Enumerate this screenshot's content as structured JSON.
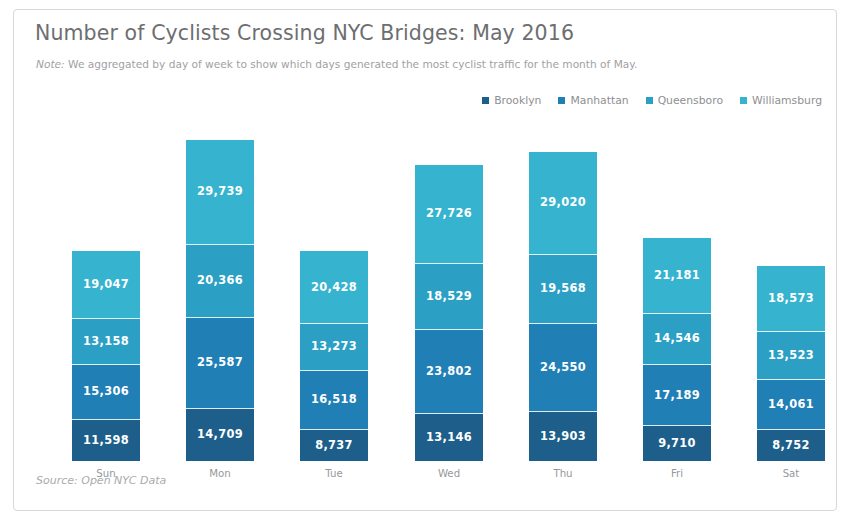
{
  "card": {
    "title": "Number of Cyclists Crossing NYC Bridges: May 2016",
    "note_prefix": "Note:",
    "note_text": " We aggregated by day of week to show which days generated the most cyclist traffic for the month of May.",
    "source": "Source: Open NYC Data"
  },
  "legend": {
    "items": [
      {
        "label": "Brooklyn",
        "color": "#1d5f8a"
      },
      {
        "label": "Manhattan",
        "color": "#2080b6"
      },
      {
        "label": "Queensboro",
        "color": "#2ba0c4"
      },
      {
        "label": "Williamsburg",
        "color": "#35b3cf"
      }
    ]
  },
  "chart_data": {
    "type": "bar",
    "stacked": true,
    "title": "Number of Cyclists Crossing NYC Bridges: May 2016",
    "subtitle": "Note: We aggregated by day of week to show which days generated the most cyclist traffic for the month of May.",
    "xlabel": "",
    "ylabel": "",
    "grid": false,
    "legend_position": "top-right",
    "axis_visible": false,
    "ylim": [
      0,
      90401
    ],
    "categories": [
      "Sun",
      "Mon",
      "Tue",
      "Wed",
      "Thu",
      "Fri",
      "Sat"
    ],
    "series": [
      {
        "name": "Brooklyn",
        "color": "#1d5f8a",
        "values": [
          11598,
          14709,
          8737,
          13146,
          13903,
          9710,
          8752
        ],
        "labels": [
          "11,598",
          "14,709",
          "8,737",
          "13,146",
          "13,903",
          "9,710",
          "8,752"
        ]
      },
      {
        "name": "Manhattan",
        "color": "#2080b6",
        "values": [
          15306,
          25587,
          16518,
          23802,
          24550,
          17189,
          14061
        ],
        "labels": [
          "15,306",
          "25,587",
          "16,518",
          "23,802",
          "24,550",
          "17,189",
          "14,061"
        ]
      },
      {
        "name": "Queensboro",
        "color": "#2ba0c4",
        "values": [
          13158,
          20366,
          13273,
          18529,
          19568,
          14546,
          13523
        ],
        "labels": [
          "13,158",
          "20,366",
          "13,273",
          "18,529",
          "19,568",
          "14,546",
          "13,523"
        ]
      },
      {
        "name": "Williamsburg",
        "color": "#35b3cf",
        "values": [
          19047,
          29739,
          20428,
          27726,
          29020,
          21181,
          18573
        ],
        "labels": [
          "19,047",
          "29,739",
          "20,428",
          "27,726",
          "29,020",
          "21,181",
          "18,573"
        ]
      }
    ],
    "totals": [
      59109,
      90401,
      58956,
      83203,
      87041,
      62626,
      54909
    ]
  },
  "layout": {
    "baseline_y": 451,
    "bar_width": 68,
    "bar_centers": [
      92,
      206,
      320,
      435,
      549,
      663,
      777
    ],
    "pixels_per_unit": 0.003555,
    "label_y": 458
  }
}
